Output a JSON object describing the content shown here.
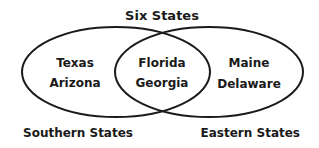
{
  "title": "Six States",
  "sets": [
    {
      "name": "Southern States",
      "only": [
        "Texas",
        "Arizona"
      ]
    },
    {
      "name": "Eastern States",
      "only": [
        "Maine",
        "Delaware"
      ]
    }
  ],
  "intersection": [
    "Florida",
    "Georgia"
  ],
  "colors": {
    "stroke": "#1a1a1a",
    "text": "#1a1a1a",
    "background": "#ffffff"
  }
}
